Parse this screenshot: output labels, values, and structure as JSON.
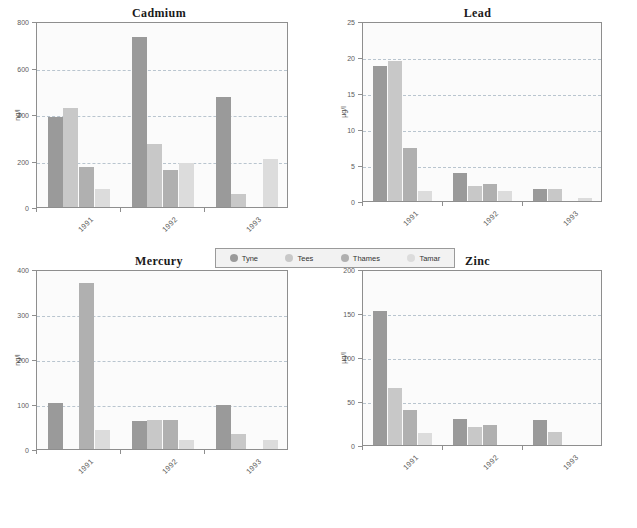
{
  "figure": {
    "series_names": [
      "Tyne",
      "Tees",
      "Thames",
      "Tamar"
    ],
    "series_colors": [
      "#9a9a9a",
      "#c8c8c8",
      "#b0b0b0",
      "#dcdcdc"
    ],
    "categories": [
      "1991",
      "1992",
      "1993"
    ]
  },
  "legend": {
    "items": [
      {
        "label": "Tyne",
        "color": "#9a9a9a"
      },
      {
        "label": "Tees",
        "color": "#c8c8c8"
      },
      {
        "label": "Thames",
        "color": "#b0b0b0"
      },
      {
        "label": "Tamar",
        "color": "#dcdcdc"
      }
    ]
  },
  "chart_data": [
    {
      "type": "bar",
      "title": "Cadmium",
      "xlabel": "",
      "ylabel": "ng/l",
      "ylim": [
        0,
        800
      ],
      "yticks": [
        0,
        200,
        400,
        600,
        800
      ],
      "grid": true,
      "legend_position": "bottom-center-shared",
      "categories": [
        "1991",
        "1992",
        "1993"
      ],
      "series": [
        {
          "name": "Tyne",
          "values": [
            388,
            733,
            475
          ]
        },
        {
          "name": "Tees",
          "values": [
            428,
            272,
            58
          ]
        },
        {
          "name": "Thames",
          "values": [
            172,
            160,
            0
          ]
        },
        {
          "name": "Tamar",
          "values": [
            78,
            188,
            205
          ]
        }
      ]
    },
    {
      "type": "bar",
      "title": "Lead",
      "xlabel": "",
      "ylabel": "µg/l",
      "ylim": [
        0,
        25
      ],
      "yticks": [
        0,
        5,
        10,
        15,
        20,
        25
      ],
      "grid": true,
      "legend_position": "bottom-center-shared",
      "categories": [
        "1991",
        "1992",
        "1993"
      ],
      "series": [
        {
          "name": "Tyne",
          "values": [
            18.8,
            3.9,
            1.6
          ]
        },
        {
          "name": "Tees",
          "values": [
            19.5,
            2.1,
            1.6
          ]
        },
        {
          "name": "Thames",
          "values": [
            7.4,
            2.3,
            0
          ]
        },
        {
          "name": "Tamar",
          "values": [
            1.4,
            1.4,
            0.4
          ]
        }
      ]
    },
    {
      "type": "bar",
      "title": "Mercury",
      "xlabel": "",
      "ylabel": "ng/l",
      "ylim": [
        0,
        400
      ],
      "yticks": [
        0,
        100,
        200,
        300,
        400
      ],
      "grid": true,
      "legend_position": "bottom-center-shared",
      "categories": [
        "1991",
        "1992",
        "1993"
      ],
      "series": [
        {
          "name": "Tyne",
          "values": [
            103,
            63,
            97
          ]
        },
        {
          "name": "Tees",
          "values": [
            0,
            65,
            33
          ]
        },
        {
          "name": "Thames",
          "values": [
            368,
            64,
            0
          ]
        },
        {
          "name": "Tamar",
          "values": [
            42,
            20,
            20
          ]
        }
      ]
    },
    {
      "type": "bar",
      "title": "Zinc",
      "xlabel": "",
      "ylabel": "µg/l",
      "ylim": [
        0,
        200
      ],
      "yticks": [
        0,
        50,
        100,
        150,
        200
      ],
      "grid": true,
      "legend_position": "bottom-center-shared",
      "categories": [
        "1991",
        "1992",
        "1993"
      ],
      "series": [
        {
          "name": "Tyne",
          "values": [
            152,
            30,
            28
          ]
        },
        {
          "name": "Tees",
          "values": [
            65,
            21,
            15
          ]
        },
        {
          "name": "Thames",
          "values": [
            40,
            23,
            0
          ]
        },
        {
          "name": "Tamar",
          "values": [
            14,
            0,
            0
          ]
        }
      ]
    }
  ]
}
